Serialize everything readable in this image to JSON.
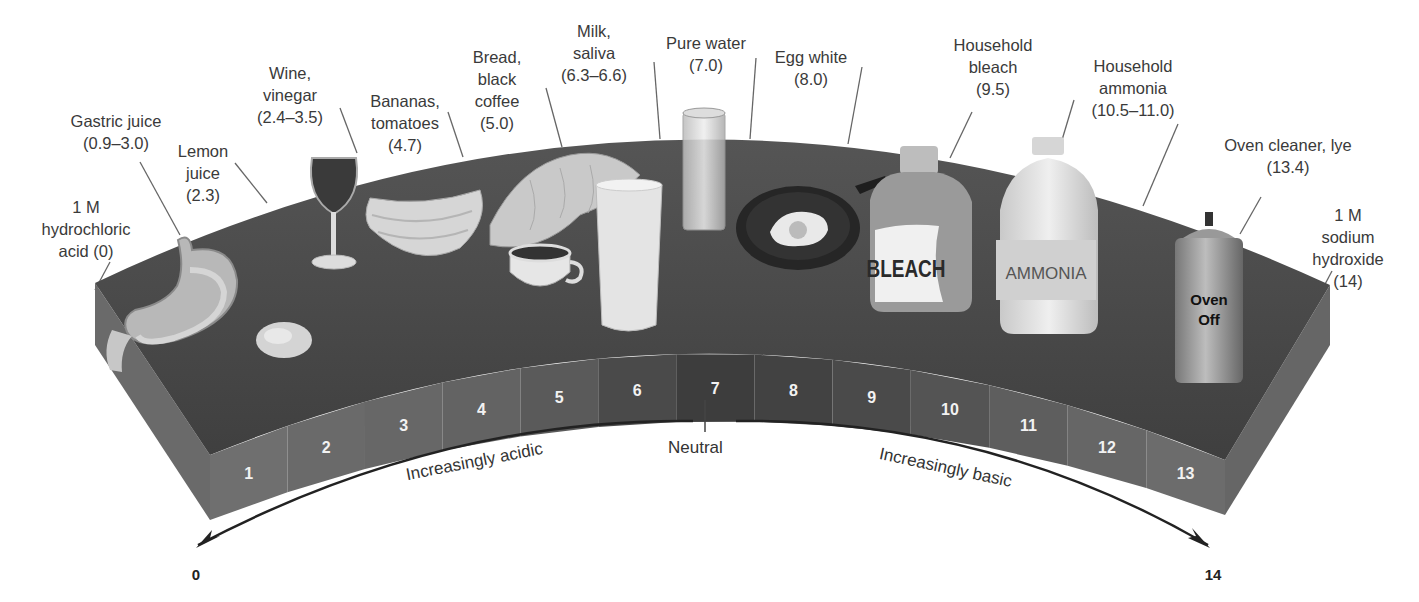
{
  "figure": {
    "scale_min": "0",
    "scale_max": "14",
    "neutral_label": "Neutral",
    "acidic_label": "Increasingly acidic",
    "basic_label": "Increasingly basic",
    "colors": {
      "slab_top": "#4a4a4a",
      "slab_side": "#6e6e6e",
      "band_dark": "#3a3a3a",
      "band_light": "#7a7a7a",
      "text": "#3a3a3a",
      "arrow": "#222222"
    }
  },
  "band_numbers": [
    "1",
    "2",
    "3",
    "4",
    "5",
    "6",
    "7",
    "8",
    "9",
    "10",
    "11",
    "12",
    "13"
  ],
  "substances": [
    {
      "label": "1 M\nhydrochloric\nacid (0)",
      "ph": "0",
      "object": "none"
    },
    {
      "label": "Gastric juice\n(0.9–3.0)",
      "ph": "0.9–3.0",
      "object": "stomach"
    },
    {
      "label": "Lemon\njuice\n(2.3)",
      "ph": "2.3",
      "object": "lemon"
    },
    {
      "label": "Wine,\nvinegar\n(2.4–3.5)",
      "ph": "2.4–3.5",
      "object": "wine glass"
    },
    {
      "label": "Bananas,\ntomatoes\n(4.7)",
      "ph": "4.7",
      "object": "bananas"
    },
    {
      "label": "Bread,\nblack\ncoffee\n(5.0)",
      "ph": "5.0",
      "object": "bread and coffee cup"
    },
    {
      "label": "Milk,\nsaliva\n(6.3–6.6)",
      "ph": "6.3–6.6",
      "object": "glass of milk"
    },
    {
      "label": "Pure water\n(7.0)",
      "ph": "7.0",
      "object": "glass of water"
    },
    {
      "label": "Egg white\n(8.0)",
      "ph": "8.0",
      "object": "egg in skillet"
    },
    {
      "label": "Household\nbleach\n(9.5)",
      "ph": "9.5",
      "object": "bleach jug",
      "product_text": "BLEACH"
    },
    {
      "label": "Household\nammonia\n(10.5–11.0)",
      "ph": "10.5–11.0",
      "object": "ammonia jug",
      "product_text": "AMMONIA"
    },
    {
      "label": "Oven cleaner, lye\n(13.4)",
      "ph": "13.4",
      "object": "spray can",
      "product_text": "Oven\nOff"
    },
    {
      "label": "1 M sodium\nhydroxide\n(14)",
      "ph": "14",
      "object": "none"
    }
  ],
  "chart_data": {
    "type": "table",
    "xlabel": "pH",
    "axis_range": [
      0,
      14
    ],
    "tick_labels": [
      "0",
      "1",
      "2",
      "3",
      "4",
      "5",
      "6",
      "7",
      "8",
      "9",
      "10",
      "11",
      "12",
      "13",
      "14"
    ],
    "annotations": [
      "Increasingly acidic",
      "Neutral",
      "Increasingly basic"
    ],
    "rows": [
      {
        "substance": "1 M hydrochloric acid",
        "ph": "0"
      },
      {
        "substance": "Gastric juice",
        "ph": "0.9–3.0"
      },
      {
        "substance": "Lemon juice",
        "ph": "2.3"
      },
      {
        "substance": "Wine, vinegar",
        "ph": "2.4–3.5"
      },
      {
        "substance": "Bananas, tomatoes",
        "ph": "4.7"
      },
      {
        "substance": "Bread, black coffee",
        "ph": "5.0"
      },
      {
        "substance": "Milk, saliva",
        "ph": "6.3–6.6"
      },
      {
        "substance": "Pure water",
        "ph": "7.0"
      },
      {
        "substance": "Egg white",
        "ph": "8.0"
      },
      {
        "substance": "Household bleach",
        "ph": "9.5"
      },
      {
        "substance": "Household ammonia",
        "ph": "10.5–11.0"
      },
      {
        "substance": "Oven cleaner, lye",
        "ph": "13.4"
      },
      {
        "substance": "1 M sodium hydroxide",
        "ph": "14"
      }
    ]
  }
}
